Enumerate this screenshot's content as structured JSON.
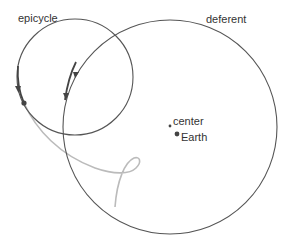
{
  "labels": {
    "epicycle": "epicycle",
    "deferent": "deferent",
    "center": "center",
    "earth": "Earth"
  },
  "colors": {
    "circle_stroke": "#555555",
    "path_trace": "#bbbbbb",
    "dot": "#444444",
    "text": "#333333"
  }
}
